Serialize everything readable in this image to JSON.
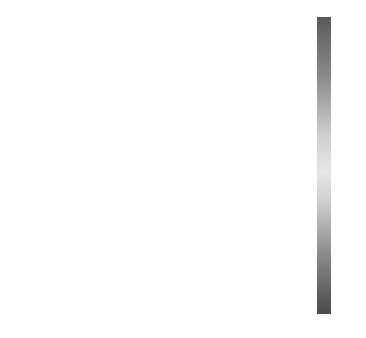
{
  "chart_data": {
    "type": "heatmap",
    "title": "",
    "colors": {
      "background": "#2b2b2b",
      "region": "#454545"
    },
    "panels": [
      {
        "label": "(a)",
        "pattern": "none"
      },
      {
        "label": "(b)",
        "pattern": "quadrants-TR-BL"
      },
      {
        "label": "(c)",
        "pattern": "right-half"
      },
      {
        "label": "(d)",
        "pattern": "quadrants-TR-BL"
      },
      {
        "label": "(e)",
        "pattern": "none"
      },
      {
        "label": "(f)",
        "pattern": "top-half"
      },
      {
        "label": "(g)",
        "pattern": "left-half"
      },
      {
        "label": "(h)",
        "pattern": "bottom-half"
      },
      {
        "label": "(i)",
        "pattern": "none"
      }
    ],
    "colorbar": {
      "min": 0,
      "max": 3.14,
      "ticks": [
        "3",
        "2.5",
        "2",
        "1.5",
        "1",
        "0.5",
        "0"
      ],
      "tick_values": [
        3,
        2.5,
        2,
        1.5,
        1,
        0.5,
        0
      ]
    }
  }
}
